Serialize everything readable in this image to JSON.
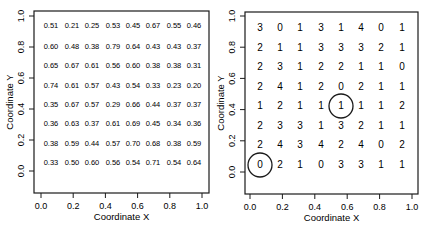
{
  "chart_data": [
    {
      "type": "table",
      "panel": "left",
      "xlabel": "Coordinate X",
      "ylabel": "Coordinate Y",
      "xlim": [
        0.0,
        1.0
      ],
      "ylim": [
        0.0,
        1.0
      ],
      "x_ticks": [
        "0.0",
        "0.2",
        "0.4",
        "0.6",
        "0.8",
        "1.0"
      ],
      "y_ticks": [
        "0.0",
        "0.2",
        "0.4",
        "0.6",
        "0.8",
        "1.0"
      ],
      "grid": false,
      "rows": [
        [
          "0.51",
          "0.21",
          "0.25",
          "0.53",
          "0.45",
          "0.67",
          "0.55",
          "0.46"
        ],
        [
          "0.60",
          "0.48",
          "0.38",
          "0.79",
          "0.64",
          "0.43",
          "0.43",
          "0.37"
        ],
        [
          "0.65",
          "0.67",
          "0.61",
          "0.56",
          "0.60",
          "0.38",
          "0.38",
          "0.31"
        ],
        [
          "0.74",
          "0.61",
          "0.57",
          "0.43",
          "0.54",
          "0.33",
          "0.23",
          "0.20"
        ],
        [
          "0.35",
          "0.67",
          "0.57",
          "0.29",
          "0.66",
          "0.44",
          "0.37",
          "0.37"
        ],
        [
          "0.36",
          "0.63",
          "0.37",
          "0.61",
          "0.69",
          "0.45",
          "0.34",
          "0.36"
        ],
        [
          "0.38",
          "0.59",
          "0.44",
          "0.57",
          "0.70",
          "0.68",
          "0.38",
          "0.59"
        ],
        [
          "0.33",
          "0.50",
          "0.60",
          "0.56",
          "0.54",
          "0.71",
          "0.54",
          "0.64"
        ]
      ]
    },
    {
      "type": "table",
      "panel": "right",
      "xlabel": "Coordinate X",
      "ylabel": "Coordinate Y",
      "xlim": [
        0.0,
        1.0
      ],
      "ylim": [
        0.0,
        1.0
      ],
      "x_ticks": [
        "0.0",
        "0.2",
        "0.4",
        "0.6",
        "0.8",
        "1.0"
      ],
      "y_ticks": [
        "0.0",
        "0.2",
        "0.4",
        "0.6",
        "0.8",
        "1.0"
      ],
      "grid": false,
      "rows": [
        [
          "3",
          "0",
          "1",
          "3",
          "1",
          "4",
          "0",
          "1"
        ],
        [
          "2",
          "1",
          "1",
          "3",
          "3",
          "3",
          "2",
          "1"
        ],
        [
          "2",
          "3",
          "1",
          "2",
          "2",
          "1",
          "1",
          "0"
        ],
        [
          "2",
          "4",
          "1",
          "2",
          "0",
          "2",
          "1",
          "1"
        ],
        [
          "1",
          "2",
          "1",
          "1",
          "1",
          "1",
          "1",
          "2"
        ],
        [
          "2",
          "3",
          "3",
          "1",
          "3",
          "2",
          "1",
          "1"
        ],
        [
          "2",
          "4",
          "3",
          "4",
          "2",
          "4",
          "0",
          "2"
        ],
        [
          "0",
          "2",
          "1",
          "0",
          "3",
          "3",
          "1",
          "1"
        ]
      ],
      "annotations": [
        {
          "type": "circle",
          "row": 4,
          "col": 4,
          "value": "1"
        },
        {
          "type": "circle",
          "row": 7,
          "col": 0,
          "value": "0"
        }
      ]
    }
  ]
}
